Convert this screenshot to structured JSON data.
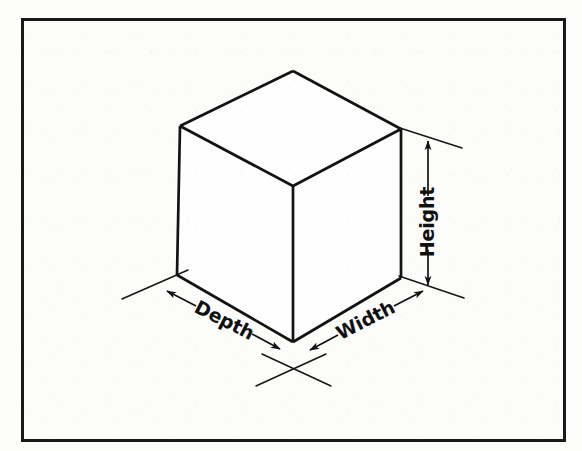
{
  "figure": {
    "background_color": "#fdfdfc",
    "frame_color": "#1a1a1a",
    "line_color": "#111111",
    "frame": {
      "x": 21,
      "y": 18,
      "width": 545,
      "height": 424,
      "border_width": 3
    }
  },
  "labels": {
    "height": "Height",
    "width": "Width",
    "depth": "Depth"
  },
  "diagram_data": {
    "type": "isometric-solid",
    "shape": "rectangular-prism",
    "vertices": {
      "top_apex": [
        293,
        71
      ],
      "top_left": [
        180,
        126
      ],
      "top_right": [
        401,
        129
      ],
      "top_center": [
        293,
        186
      ],
      "bottom_left": [
        177,
        275
      ],
      "bottom_right": [
        401,
        278
      ],
      "bottom_center": [
        293,
        342
      ]
    },
    "visible_faces": [
      "top",
      "left",
      "right"
    ],
    "edge_width": 2.6,
    "dimensions": [
      {
        "name": "Height",
        "axis": "vertical",
        "text_rotation_deg": -90,
        "text_anchor": [
          428,
          222
        ],
        "dimension_line": {
          "from": [
            428,
            140
          ],
          "to": [
            428,
            285
          ]
        },
        "arrowheads": [
          "start",
          "end"
        ],
        "extension_lines": [
          {
            "from": [
              401,
              129
            ],
            "to": [
              461,
              148
            ]
          },
          {
            "from": [
              403,
              277
            ],
            "to": [
              462,
              297
            ]
          }
        ]
      },
      {
        "name": "Width",
        "axis": "right-lower-edge",
        "text_rotation_deg": -27,
        "text_anchor": [
          355,
          322
        ],
        "dimension_line": {
          "from": [
            312,
            349
          ],
          "to": [
            420,
            296
          ]
        },
        "arrowheads": [
          "start",
          "end"
        ],
        "extension_lines": [
          {
            "from": [
              264,
              355
            ],
            "to": [
              330,
              385
            ]
          },
          {
            "from": [
              403,
              277
            ],
            "to": [
              462,
              297
            ]
          }
        ]
      },
      {
        "name": "Depth",
        "axis": "left-lower-edge",
        "text_rotation_deg": 27,
        "text_anchor": [
          230,
          323
        ],
        "dimension_line": {
          "from": [
            169,
            292
          ],
          "to": [
            276,
            348
          ]
        },
        "arrowheads": [
          "start",
          "end"
        ],
        "extension_lines": [
          {
            "from": [
              124,
              298
            ],
            "to": [
              186,
              272
            ]
          },
          {
            "from": [
              258,
              385
            ],
            "to": [
              324,
              355
            ]
          }
        ]
      }
    ]
  }
}
